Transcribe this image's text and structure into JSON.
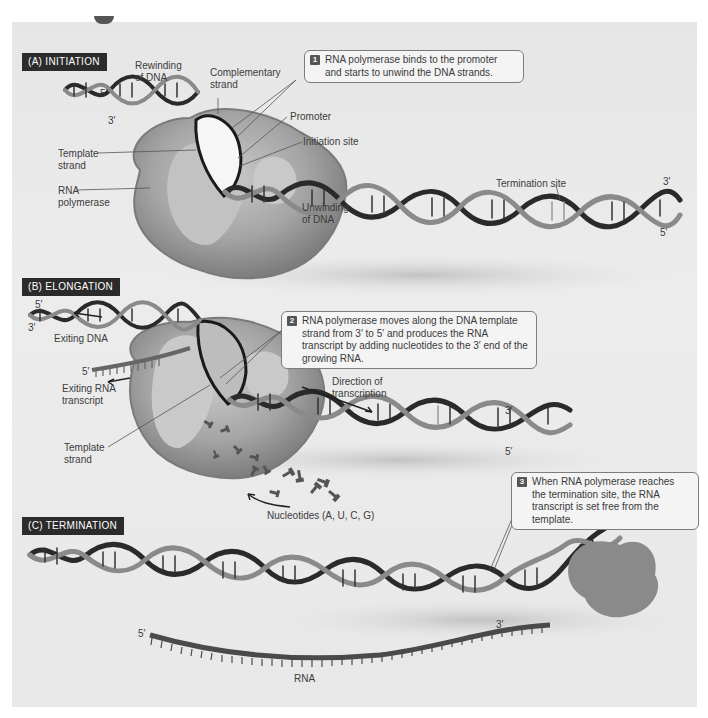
{
  "figure": {
    "sections": [
      {
        "id": "A",
        "label": "(A)  INITIATION",
        "step_number": "1",
        "callout": "RNA polymerase binds to the promoter and starts to unwind the DNA strands.",
        "labels": {
          "rewinding": "Rewinding\nof DNA",
          "complementary": "Complementary\nstrand",
          "promoter": "Promoter",
          "initiation_site": "Initiation site",
          "template": "Template\nstrand",
          "rna_polymerase": "RNA\npolymerase",
          "unwinding": "Unwinding\nof DNA",
          "termination_site": "Termination site"
        },
        "ends": {
          "left_top": "5′",
          "left_bottom": "3′",
          "right_top": "3′",
          "right_bottom": "5′"
        }
      },
      {
        "id": "B",
        "label": "(B)  ELONGATION",
        "step_number": "2",
        "callout": "RNA polymerase moves along the DNA template strand from 3′ to 5′ and produces the RNA transcript by adding nucleotides to the 3′ end of the growing RNA.",
        "labels": {
          "exiting_dna": "Exiting DNA",
          "exiting_rna": "Exiting RNA\ntranscript",
          "template": "Template\nstrand",
          "direction": "Direction of\ntranscription",
          "nucleotides": "Nucleotides (A, U, C, G)",
          "rna_5prime": "5′"
        },
        "ends": {
          "left_top": "5′",
          "left_bottom": "3′",
          "right_top": "3′",
          "right_bottom": "5′"
        }
      },
      {
        "id": "C",
        "label": "(C)  TERMINATION",
        "step_number": "3",
        "callout": "When RNA polymerase reaches the termination site, the RNA transcript is set free from the template.",
        "labels": {
          "rna": "RNA"
        },
        "ends": {
          "rna_left": "5′",
          "rna_right": "3′"
        }
      }
    ],
    "colors": {
      "background": "#e8e8e8",
      "label_box": "#2b2b2b",
      "dna_dark": "#2a2a2a",
      "dna_light": "#8a8a8a",
      "polymerase": "#8c8c8c",
      "polymerase_light": "#bdbdbd",
      "rna": "#555555"
    }
  }
}
